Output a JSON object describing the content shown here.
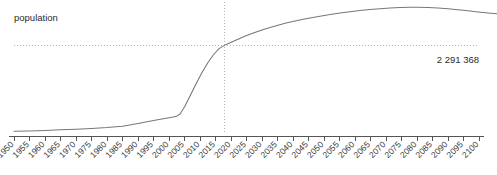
{
  "chart_data": {
    "type": "line",
    "title": "",
    "subtitle": "",
    "series_label": "population",
    "xlabel": "",
    "ylabel": "population",
    "grid": false,
    "legend_position": "none",
    "x_tick_labels": [
      "1950",
      "1955",
      "1960",
      "1965",
      "1970",
      "1975",
      "1980",
      "1985",
      "1990",
      "1995",
      "2000",
      "2005",
      "2010",
      "2015",
      "2020",
      "2025",
      "2030",
      "2035",
      "2040",
      "2045",
      "2050",
      "2055",
      "2060",
      "2065",
      "2070",
      "2075",
      "2080",
      "2085",
      "2090",
      "2095",
      "2100"
    ],
    "x_tick_rotation_deg": 45,
    "xlim": [
      1950,
      2100
    ],
    "ylim": [
      0,
      2600000
    ],
    "y_axis_visible": false,
    "highlight": {
      "x_value": "2017",
      "y_value_label": "2 291 368",
      "y_value": 2291368,
      "crosshair_vertical": true,
      "crosshair_horizontal": true
    },
    "series": [
      {
        "name": "population",
        "x": [
          1950,
          1955,
          1960,
          1965,
          1970,
          1975,
          1980,
          1985,
          1990,
          1995,
          2000,
          2005,
          2010,
          2015,
          2017,
          2020,
          2025,
          2030,
          2035,
          2040,
          2045,
          2050,
          2055,
          2060,
          2065,
          2070,
          2075,
          2080,
          2085,
          2090,
          2095,
          2100
        ],
        "values": [
          121000,
          128000,
          136000,
          146000,
          158000,
          172000,
          190000,
          215000,
          268000,
          330000,
          395000,
          470000,
          1180000,
          2090000,
          2291368,
          2420000,
          2620000,
          2780000,
          2900000,
          3000000,
          3080000,
          3150000,
          3200000,
          3240000,
          3268000,
          3282000,
          3285000,
          3278000,
          3262000,
          3240000,
          3212000,
          3180000
        ]
      }
    ],
    "colors": {
      "line": "#777777",
      "axis": "#555555",
      "tick_label": "#3a3a3a",
      "crosshair": "#b5b5b5",
      "background": "#ffffff",
      "text": "#2b2b2b"
    }
  },
  "geometry": {
    "axis_y": 136,
    "plot_left": 14,
    "plot_right": 479,
    "tick_step": 15.5,
    "tick_length": 5,
    "crosshair_x": 224,
    "crosshair_y": 45.5,
    "series_label_pos": {
      "x": 14,
      "y": 21
    },
    "value_label_pos": {
      "x": 479,
      "y": 63
    },
    "curve_path": "M 14,131.3 L 29.5,130.9 L 45,130.4 L 60.5,129.8 L 76,129.2 L 91.5,128.4 L 107,127.5 L 122.5,126.2 L 138,123.5 L 153.5,120.6 L 169,117.7 L 176,116.6 L 180,114.0 L 184.5,107.0 L 190,96.0 L 196,84.0 L 202,72.5 L 208,62.5 L 214,54.0 L 219,48.6 L 224,45.6 L 229,43.2 L 238,39.2 L 246,35.8 L 254,32.8 L 262,30.0 L 270,27.5 L 278,25.2 L 286,23.1 L 294,21.2 L 302,19.5 L 310,17.9 L 320,16.2 L 330,14.6 L 340,13.1 L 350,11.8 L 360,10.6 L 370,9.6 L 380,8.8 L 390,8.1 L 400,7.6 L 410,7.3 L 418,7.2 L 428,7.4 L 438,7.9 L 448,8.7 L 458,9.7 L 468,10.8 L 478,11.9 L 488,12.9 L 497,13.8"
  }
}
